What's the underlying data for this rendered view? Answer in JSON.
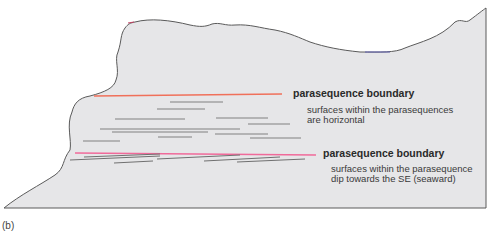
{
  "figure_label": "(b)",
  "colors": {
    "rock_fill": "#e6e6e8",
    "outline": "#5a5a5a",
    "upper_boundary": "#f0705a",
    "lower_boundary": "#f06a9a",
    "bedding": "#808080"
  },
  "annotations": {
    "upper": {
      "title": "parasequence boundary",
      "desc_line1": "surfaces within the parasequences",
      "desc_line2": "are horizontal"
    },
    "lower": {
      "title": "parasequence boundary",
      "desc_line1": "surfaces within the parasequence",
      "desc_line2": "dip towards the SE (seaward)"
    }
  }
}
